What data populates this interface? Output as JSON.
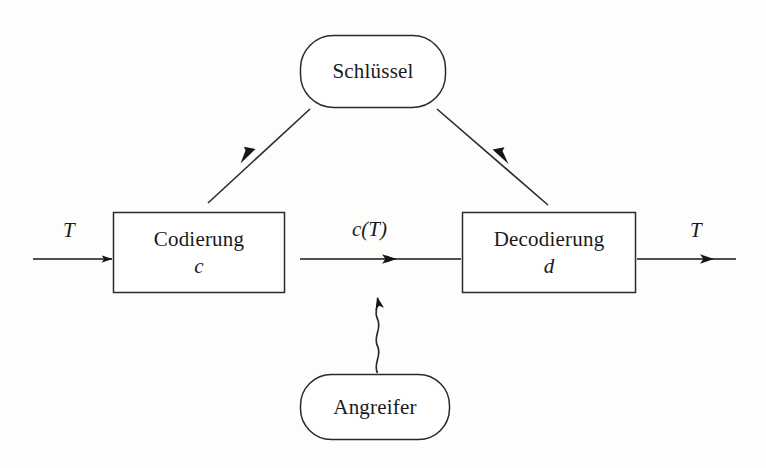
{
  "diagram": {
    "background_color": "#fdfdfc",
    "ink_color": "#1a1a1a",
    "nodes": {
      "schluessel": {
        "label": "Schlüssel",
        "shape": "rounded-rect"
      },
      "codierung": {
        "label": "Codierung",
        "sublabel": "c",
        "shape": "rect"
      },
      "decodierung": {
        "label": "Decodierung",
        "sublabel": "d",
        "shape": "rect"
      },
      "angreifer": {
        "label": "Angreifer",
        "shape": "rounded-rect"
      }
    },
    "edges": {
      "input": {
        "label": "T",
        "style": "straight-arrow",
        "direction": "right"
      },
      "middle": {
        "label": "c(T)",
        "style": "straight-arrow",
        "direction": "right"
      },
      "output": {
        "label": "T",
        "style": "straight-arrow",
        "direction": "right"
      },
      "key_to_codierung": {
        "label": "",
        "style": "diagonal-arrow",
        "direction": "down-left"
      },
      "key_to_decodierung": {
        "label": "",
        "style": "diagonal-arrow",
        "direction": "down-right"
      },
      "attacker_to_channel": {
        "label": "",
        "style": "squiggly-arrow",
        "direction": "up"
      }
    }
  }
}
